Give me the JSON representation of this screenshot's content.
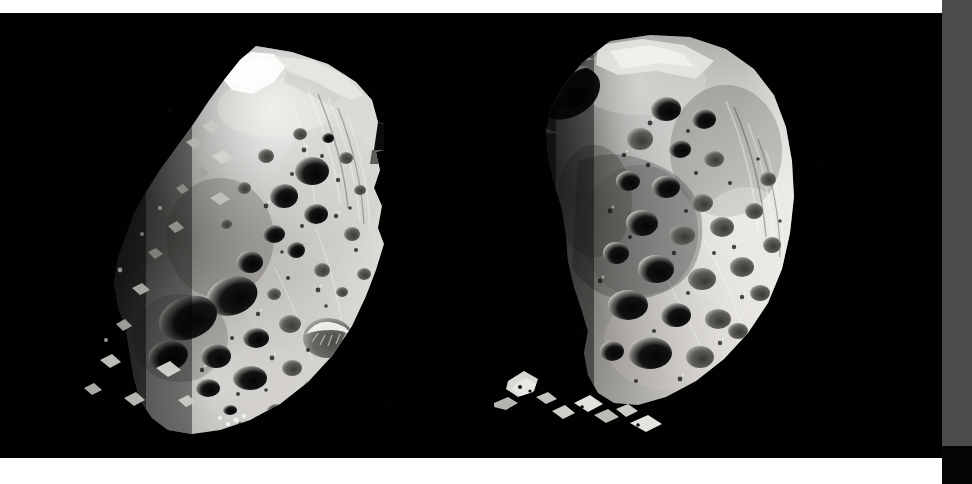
{
  "image": {
    "kind": "astronomical-photograph",
    "subject": "Phoebe",
    "body_type": "moon",
    "parent_planet": "Saturn",
    "panel_count": 2,
    "background_color": "#010101",
    "frame": {
      "top_band_color": "#ffffff",
      "bottom_band_color": "#ffffff",
      "right_strip_color": "#4b4b4b",
      "right_strip_lower_color": "#050505"
    },
    "alt_text": "Two black-and-white views of the heavily cratered, irregularly shaped moon Phoebe, each lit as a crescent from the right, against a black starless sky."
  },
  "panels": [
    {
      "id": "panel-left",
      "label": "Left view of Phoebe",
      "terminator_side": "left",
      "illumination": "crescent lit from upper right",
      "surface": "heavily cratered regolith with bright rims and dark crater floors",
      "notable_features": [
        "bright illuminated ridge along the upper limb",
        "large dark crater cluster at center-left",
        "stair-stepped mosaic seam along the right limb",
        "isolated sunlit peaks detached in shadow at the lower left"
      ],
      "tones": {
        "highlight": "#f2f1ee",
        "midtone": "#9d9b97",
        "shadow": "#3a3937",
        "crater_floor": "#0c0c0c"
      }
    },
    {
      "id": "panel-right",
      "label": "Right view of Phoebe",
      "terminator_side": "left",
      "illumination": "crescent lit from the right",
      "surface": "densely cratered with a prominent rimmed crater near the upper left limb",
      "notable_features": [
        "prominent crater with bright sunlit rim at upper left",
        "broad bright limb sweeping down the right side",
        "chain of overlapping craters across the middle",
        "detached sunlit fragments near the bottom left"
      ],
      "tones": {
        "highlight": "#fbfbfa",
        "midtone": "#a9a7a3",
        "shadow": "#35332f",
        "crater_floor": "#090909"
      }
    }
  ],
  "palette": {
    "white": "#ffffff",
    "black": "#010101",
    "gray_strip": "#4b4b4b"
  }
}
